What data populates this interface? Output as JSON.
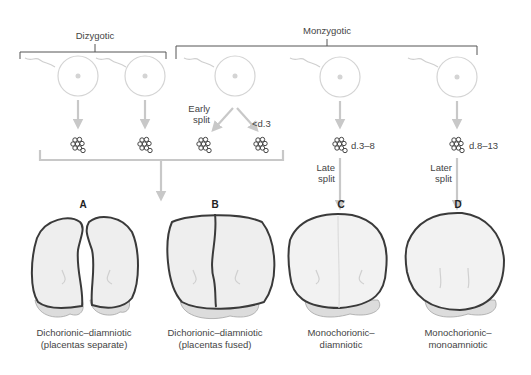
{
  "groups": {
    "dizygotic": "Dizygotic",
    "monozygotic": "Monzygotic"
  },
  "split_labels": {
    "early": [
      "Early",
      "split"
    ],
    "lt_d3": "<d.3",
    "d3_8": "d.3–8",
    "late": [
      "Late",
      "split"
    ],
    "d8_13": "d.8–13",
    "later": [
      "Later",
      "split"
    ]
  },
  "panels": [
    {
      "letter": "A",
      "caption": [
        "Dichorionic–diamniotic",
        "(placentas separate)"
      ]
    },
    {
      "letter": "B",
      "caption": [
        "Dichorionic–diamniotic",
        "(placentas fused)"
      ]
    },
    {
      "letter": "C",
      "caption": [
        "Monochorionic–",
        "diamniotic"
      ]
    },
    {
      "letter": "D",
      "caption": [
        "Monochorionic–",
        "monoamniotic"
      ]
    }
  ],
  "colors": {
    "outline": "#3a3a3a",
    "arrow": "#c8c8c8",
    "egg": "#d4d4d4",
    "sac_fill": "#ececec",
    "placenta": "#dcdcdc"
  }
}
